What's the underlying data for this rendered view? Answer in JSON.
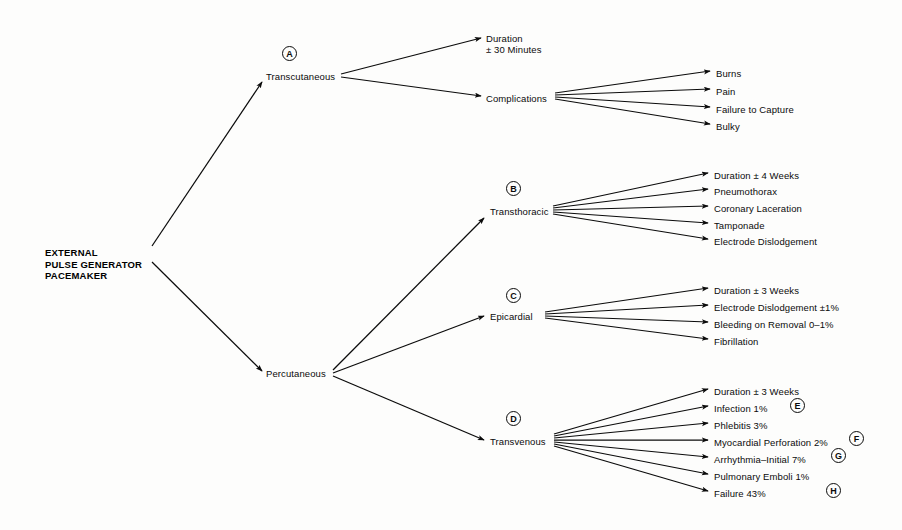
{
  "diagram": {
    "root": {
      "lines": [
        "EXTERNAL",
        "PULSE GENERATOR",
        "PACEMAKER"
      ],
      "x": 45,
      "y": 247
    },
    "nodes": [
      {
        "id": "transcutaneous",
        "label": "Transcutaneous",
        "x": 266,
        "y": 71,
        "tag": "A",
        "tag_x": 282,
        "tag_y": 46
      },
      {
        "id": "duration-tc",
        "label": "Duration",
        "x": 486,
        "y": 33,
        "tag": null
      },
      {
        "id": "duration-tc-2",
        "label": "± 30 Minutes",
        "x": 486,
        "y": 44,
        "tag": null
      },
      {
        "id": "complications",
        "label": "Complications",
        "x": 486,
        "y": 93,
        "tag": null
      },
      {
        "id": "burns",
        "label": "Burns",
        "x": 716,
        "y": 68,
        "tag": null
      },
      {
        "id": "pain",
        "label": "Pain",
        "x": 716,
        "y": 86,
        "tag": null
      },
      {
        "id": "failure-capture",
        "label": "Failure to Capture",
        "x": 716,
        "y": 104,
        "tag": null
      },
      {
        "id": "bulky",
        "label": "Bulky",
        "x": 716,
        "y": 121,
        "tag": null
      },
      {
        "id": "percutaneous",
        "label": "Percutaneous",
        "x": 266,
        "y": 368,
        "tag": null
      },
      {
        "id": "transthoracic",
        "label": "Transthoracic",
        "x": 490,
        "y": 206,
        "tag": "B",
        "tag_x": 506,
        "tag_y": 181
      },
      {
        "id": "duration-tt",
        "label": "Duration ± 4 Weeks",
        "x": 714,
        "y": 170,
        "tag": null
      },
      {
        "id": "pneumothorax",
        "label": "Pneumothorax",
        "x": 714,
        "y": 186,
        "tag": null
      },
      {
        "id": "coronary-lac",
        "label": "Coronary Laceration",
        "x": 714,
        "y": 203,
        "tag": null
      },
      {
        "id": "tamponade",
        "label": "Tamponade",
        "x": 714,
        "y": 220,
        "tag": null
      },
      {
        "id": "electrode-dis-tt",
        "label": "Electrode Dislodgement",
        "x": 714,
        "y": 236,
        "tag": null
      },
      {
        "id": "epicardial",
        "label": "Epicardial",
        "x": 490,
        "y": 311,
        "tag": "C",
        "tag_x": 506,
        "tag_y": 288
      },
      {
        "id": "duration-ep",
        "label": "Duration ± 3 Weeks",
        "x": 714,
        "y": 285,
        "tag": null
      },
      {
        "id": "electrode-dis-ep",
        "label": "Electrode Dislodgement ±1%",
        "x": 714,
        "y": 302,
        "tag": null
      },
      {
        "id": "bleeding",
        "label": "Bleeding on Removal 0–1%",
        "x": 714,
        "y": 319,
        "tag": null
      },
      {
        "id": "fibrillation",
        "label": "Fibrillation",
        "x": 714,
        "y": 336,
        "tag": null
      },
      {
        "id": "transvenous",
        "label": "Transvenous",
        "x": 490,
        "y": 436,
        "tag": "D",
        "tag_x": 506,
        "tag_y": 411
      },
      {
        "id": "duration-tv",
        "label": "Duration ± 3 Weeks",
        "x": 714,
        "y": 386,
        "tag": null
      },
      {
        "id": "infection",
        "label": "Infection 1%",
        "x": 714,
        "y": 403,
        "tag": "E",
        "tag_x": 790,
        "tag_y": 398
      },
      {
        "id": "phlebitis",
        "label": "Phlebitis 3%",
        "x": 714,
        "y": 420,
        "tag": null
      },
      {
        "id": "myocardial-perf",
        "label": "Myocardial Perforation 2%",
        "x": 714,
        "y": 437,
        "tag": "F",
        "tag_x": 849,
        "tag_y": 431
      },
      {
        "id": "arrhythmia",
        "label": "Arrhythmia–Initial 7%",
        "x": 714,
        "y": 454,
        "tag": "G",
        "tag_x": 831,
        "tag_y": 448
      },
      {
        "id": "pulmonary-emboli",
        "label": "Pulmonary Emboli 1%",
        "x": 714,
        "y": 471,
        "tag": null
      },
      {
        "id": "failure-43",
        "label": "Failure 43%",
        "x": 714,
        "y": 488,
        "tag": "H",
        "tag_x": 826,
        "tag_y": 483
      }
    ],
    "edges": [
      {
        "from": "root",
        "to": "transcutaneous",
        "x1": 152,
        "y1": 246,
        "x2": 262,
        "y2": 82
      },
      {
        "from": "root",
        "to": "percutaneous",
        "x1": 152,
        "y1": 262,
        "x2": 262,
        "y2": 371
      },
      {
        "from": "transcutaneous",
        "to": "duration-tc",
        "x1": 341,
        "y1": 74,
        "x2": 481,
        "y2": 38
      },
      {
        "from": "transcutaneous",
        "to": "complications",
        "x1": 341,
        "y1": 77,
        "x2": 481,
        "y2": 96
      },
      {
        "from": "complications",
        "to": "burns",
        "x1": 555,
        "y1": 93,
        "x2": 710,
        "y2": 71
      },
      {
        "from": "complications",
        "to": "pain",
        "x1": 555,
        "y1": 95,
        "x2": 710,
        "y2": 89
      },
      {
        "from": "complications",
        "to": "failure-capture",
        "x1": 555,
        "y1": 97,
        "x2": 710,
        "y2": 107
      },
      {
        "from": "complications",
        "to": "bulky",
        "x1": 555,
        "y1": 99,
        "x2": 710,
        "y2": 124
      },
      {
        "from": "percutaneous",
        "to": "transthoracic",
        "x1": 333,
        "y1": 370,
        "x2": 484,
        "y2": 218
      },
      {
        "from": "percutaneous",
        "to": "epicardial",
        "x1": 333,
        "y1": 373,
        "x2": 484,
        "y2": 316
      },
      {
        "from": "percutaneous",
        "to": "transvenous",
        "x1": 333,
        "y1": 376,
        "x2": 484,
        "y2": 440
      },
      {
        "from": "transthoracic",
        "to": "duration-tt",
        "x1": 553,
        "y1": 206,
        "x2": 708,
        "y2": 173
      },
      {
        "from": "transthoracic",
        "to": "pneumothorax",
        "x1": 553,
        "y1": 208,
        "x2": 708,
        "y2": 189
      },
      {
        "from": "transthoracic",
        "to": "coronary-lac",
        "x1": 553,
        "y1": 210,
        "x2": 708,
        "y2": 206
      },
      {
        "from": "transthoracic",
        "to": "tamponade",
        "x1": 553,
        "y1": 212,
        "x2": 708,
        "y2": 223
      },
      {
        "from": "transthoracic",
        "to": "electrode-dis-tt",
        "x1": 553,
        "y1": 214,
        "x2": 708,
        "y2": 239
      },
      {
        "from": "epicardial",
        "to": "duration-ep",
        "x1": 545,
        "y1": 312,
        "x2": 708,
        "y2": 288
      },
      {
        "from": "epicardial",
        "to": "electrode-dis-ep",
        "x1": 545,
        "y1": 314,
        "x2": 708,
        "y2": 305
      },
      {
        "from": "epicardial",
        "to": "bleeding",
        "x1": 545,
        "y1": 316,
        "x2": 708,
        "y2": 322
      },
      {
        "from": "epicardial",
        "to": "fibrillation",
        "x1": 545,
        "y1": 318,
        "x2": 708,
        "y2": 339
      },
      {
        "from": "transvenous",
        "to": "duration-tv",
        "x1": 554,
        "y1": 434,
        "x2": 708,
        "y2": 389
      },
      {
        "from": "transvenous",
        "to": "infection",
        "x1": 554,
        "y1": 436,
        "x2": 708,
        "y2": 406
      },
      {
        "from": "transvenous",
        "to": "phlebitis",
        "x1": 554,
        "y1": 438,
        "x2": 708,
        "y2": 423
      },
      {
        "from": "transvenous",
        "to": "myocardial-perf",
        "x1": 554,
        "y1": 440,
        "x2": 708,
        "y2": 440
      },
      {
        "from": "transvenous",
        "to": "arrhythmia",
        "x1": 554,
        "y1": 442,
        "x2": 708,
        "y2": 457
      },
      {
        "from": "transvenous",
        "to": "pulmonary-emboli",
        "x1": 554,
        "y1": 444,
        "x2": 708,
        "y2": 474
      },
      {
        "from": "transvenous",
        "to": "failure-43",
        "x1": 554,
        "y1": 446,
        "x2": 708,
        "y2": 491
      }
    ],
    "colors": {
      "ink": "#0b0b0b",
      "background": "#fdfdfc"
    }
  }
}
